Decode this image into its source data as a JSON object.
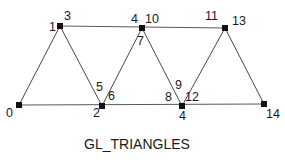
{
  "diagram": {
    "caption": "GL_TRIANGLES",
    "vertices": [
      {
        "id": "v-bottom-left",
        "x": 19,
        "y": 105
      },
      {
        "id": "v-top-1",
        "x": 60,
        "y": 26
      },
      {
        "id": "v-bottom-2",
        "x": 102,
        "y": 106
      },
      {
        "id": "v-top-2",
        "x": 142,
        "y": 28
      },
      {
        "id": "v-bottom-3",
        "x": 182,
        "y": 106
      },
      {
        "id": "v-top-3",
        "x": 225,
        "y": 28
      },
      {
        "id": "v-bottom-right",
        "x": 264,
        "y": 104
      }
    ],
    "labels": [
      {
        "text": "0",
        "x": 6,
        "y": 117
      },
      {
        "text": "1",
        "x": 49,
        "y": 31
      },
      {
        "text": "3",
        "x": 64,
        "y": 20
      },
      {
        "text": "2",
        "x": 93,
        "y": 117
      },
      {
        "text": "5",
        "x": 96,
        "y": 91
      },
      {
        "text": "6",
        "x": 108,
        "y": 100
      },
      {
        "text": "4",
        "x": 131,
        "y": 23
      },
      {
        "text": "10",
        "x": 145,
        "y": 23
      },
      {
        "text": "7",
        "x": 137,
        "y": 45
      },
      {
        "text": "8",
        "x": 165,
        "y": 101
      },
      {
        "text": "9",
        "x": 175,
        "y": 89
      },
      {
        "text": "12",
        "x": 185,
        "y": 101
      },
      {
        "text": "4",
        "x": 179,
        "y": 120
      },
      {
        "text": "11",
        "x": 205,
        "y": 20
      },
      {
        "text": "13",
        "x": 232,
        "y": 25
      },
      {
        "text": "14",
        "x": 266,
        "y": 118
      }
    ],
    "colors": {
      "vertex": "#111111",
      "edge": "#333333",
      "text": "#1a1a1a",
      "background": "#ffffff"
    }
  }
}
